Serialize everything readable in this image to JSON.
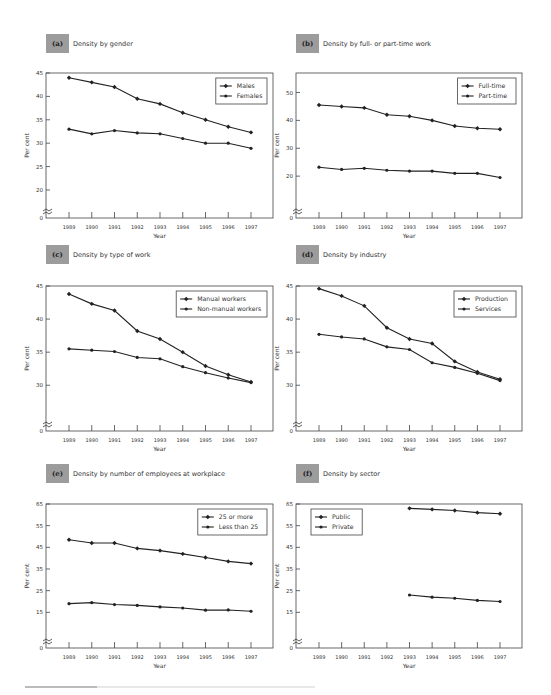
{
  "chart_data": [
    {
      "id": "a",
      "type": "line",
      "label": "(a)",
      "title": "Density by gender",
      "xlabel": "Year",
      "ylabel": "Per cent",
      "x": [
        "1989",
        "1990",
        "1991",
        "1992",
        "1993",
        "1994",
        "1995",
        "1996",
        "1997"
      ],
      "yticks": [
        0,
        20,
        25,
        30,
        35,
        40,
        45
      ],
      "ylim": [
        17,
        45
      ],
      "axis_break": true,
      "legend_position": "upper right",
      "grid": false,
      "series": [
        {
          "name": "Males",
          "marker": "diamond",
          "values": [
            44,
            43,
            42,
            39.5,
            38.4,
            36.5,
            35,
            33.5,
            32.3
          ]
        },
        {
          "name": "Females",
          "marker": "star",
          "values": [
            33,
            32,
            32.7,
            32.2,
            32,
            31,
            30,
            30,
            28.9
          ]
        }
      ]
    },
    {
      "id": "b",
      "type": "line",
      "label": "(b)",
      "title": "Density by full- or part-time work",
      "xlabel": "Year",
      "ylabel": "Per cent",
      "x": [
        "1989",
        "1990",
        "1991",
        "1992",
        "1993",
        "1994",
        "1995",
        "1996",
        "1997"
      ],
      "yticks": [
        0,
        20,
        30,
        40,
        50
      ],
      "ylim": [
        10,
        57
      ],
      "axis_break": true,
      "legend_position": "upper right",
      "grid": false,
      "series": [
        {
          "name": "Full-time",
          "marker": "diamond",
          "values": [
            45.5,
            45,
            44.5,
            42,
            41.5,
            40,
            38,
            37.2,
            36.8
          ]
        },
        {
          "name": "Part-time",
          "marker": "star",
          "values": [
            23.2,
            22.4,
            22.8,
            22.1,
            21.8,
            21.8,
            21,
            21,
            19.5
          ]
        }
      ]
    },
    {
      "id": "c",
      "type": "line",
      "label": "(c)",
      "title": "Density by type of work",
      "xlabel": "Year",
      "ylabel": "Per cent",
      "x": [
        "1989",
        "1990",
        "1991",
        "1992",
        "1993",
        "1994",
        "1995",
        "1996",
        "1997"
      ],
      "yticks": [
        0,
        30,
        35,
        40,
        45
      ],
      "ylim": [
        25.2,
        45
      ],
      "axis_break": true,
      "legend_position": "upper right",
      "grid": false,
      "series": [
        {
          "name": "Manual workers",
          "marker": "diamond",
          "values": [
            43.8,
            42.3,
            41.3,
            38.2,
            37,
            35,
            32.9,
            31.6,
            30.5
          ]
        },
        {
          "name": "Non-manual workers",
          "marker": "star",
          "values": [
            35.5,
            35.3,
            35.1,
            34.2,
            34,
            32.8,
            31.9,
            31.1,
            30.4
          ]
        }
      ]
    },
    {
      "id": "d",
      "type": "line",
      "label": "(d)",
      "title": "Density by industry",
      "xlabel": "Year",
      "ylabel": "Per cent",
      "x": [
        "1989",
        "1990",
        "1991",
        "1992",
        "1993",
        "1994",
        "1995",
        "1996",
        "1997"
      ],
      "yticks": [
        0,
        30,
        35,
        40,
        45
      ],
      "ylim": [
        25.2,
        45
      ],
      "axis_break": true,
      "legend_position": "upper right",
      "grid": false,
      "series": [
        {
          "name": "Production",
          "marker": "diamond",
          "values": [
            44.6,
            43.5,
            42,
            38.7,
            37,
            36.3,
            33.6,
            32,
            30.9
          ]
        },
        {
          "name": "Services",
          "marker": "star",
          "values": [
            37.7,
            37.3,
            37,
            35.8,
            35.4,
            33.4,
            32.7,
            31.8,
            30.7
          ]
        }
      ]
    },
    {
      "id": "e",
      "type": "line",
      "label": "(e)",
      "title": "Density by number of employees at workplace",
      "xlabel": "Year",
      "ylabel": "Per cent",
      "x": [
        "1989",
        "1990",
        "1991",
        "1992",
        "1993",
        "1994",
        "1995",
        "1996",
        "1997"
      ],
      "yticks": [
        0,
        15,
        25,
        35,
        45,
        55,
        65
      ],
      "ylim": [
        5,
        65
      ],
      "axis_break": true,
      "legend_position": "upper right",
      "grid": false,
      "series": [
        {
          "name": "25 or more",
          "marker": "diamond",
          "values": [
            48.5,
            47,
            47,
            44.5,
            43.5,
            42,
            40.3,
            38.5,
            37.5
          ]
        },
        {
          "name": "Less than 25",
          "marker": "star",
          "values": [
            19,
            19.5,
            18.6,
            18.2,
            17.5,
            17,
            16,
            16.1,
            15.5
          ]
        }
      ]
    },
    {
      "id": "f",
      "type": "line",
      "label": "(f)",
      "title": "Density by sector",
      "xlabel": "Year",
      "ylabel": "Per cent",
      "x": [
        "1989",
        "1990",
        "1991",
        "1992",
        "1993",
        "1994",
        "1995",
        "1996",
        "1997"
      ],
      "yticks": [
        0,
        15,
        25,
        35,
        45,
        55,
        65
      ],
      "ylim": [
        5,
        65
      ],
      "axis_break": true,
      "legend_position": "upper left",
      "grid": false,
      "series": [
        {
          "name": "Public",
          "marker": "diamond",
          "values": [
            null,
            null,
            null,
            null,
            63,
            62.5,
            62,
            61,
            60.5
          ]
        },
        {
          "name": "Private",
          "marker": "star",
          "values": [
            null,
            null,
            null,
            null,
            23,
            22,
            21.5,
            20.5,
            20
          ]
        }
      ]
    }
  ],
  "colors": {
    "badge": "#9c9c9c",
    "line": "#222222",
    "axis": "#333333"
  }
}
